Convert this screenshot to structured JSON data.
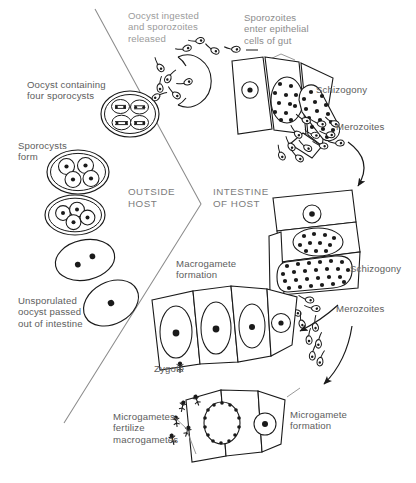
{
  "diagram": {
    "regions": [
      {
        "name": "outside-host",
        "label": "OUTSIDE\nHOST",
        "x": 128,
        "y": 186
      },
      {
        "name": "intestine-of-host",
        "label": "INTESTINE\nOF HOST",
        "x": 213,
        "y": 186
      }
    ],
    "labels": [
      {
        "name": "oocyst-ingested",
        "text": "Oocyst ingested\nand sporozoites\nreleased",
        "x": 128,
        "y": 10,
        "style": "faded"
      },
      {
        "name": "sporozoites-enter",
        "text": "Sporozoites\nenter epithelial\ncells of gut",
        "x": 244,
        "y": 12,
        "style": "faded2"
      },
      {
        "name": "schizogony-upper",
        "text": "Schizogony",
        "x": 316,
        "y": 84,
        "style": ""
      },
      {
        "name": "merozoites-upper",
        "text": "Merozoites",
        "x": 336,
        "y": 121,
        "style": ""
      },
      {
        "name": "oocyst-four-sporocysts",
        "text": "Oocyst containing\nfour sporocysts",
        "x": 27,
        "y": 79,
        "style": ""
      },
      {
        "name": "sporocysts-form",
        "text": "Sporocysts\nform",
        "x": 18,
        "y": 140,
        "style": ""
      },
      {
        "name": "unsporulated-oocyst",
        "text": "Unsporulated\noocyst passed\nout of intestine",
        "x": 18,
        "y": 295,
        "style": ""
      },
      {
        "name": "macrogamete-formation",
        "text": "Macrogamete\nformation",
        "x": 176,
        "y": 258,
        "style": ""
      },
      {
        "name": "schizogony-lower",
        "text": "Schizogony",
        "x": 350,
        "y": 263,
        "style": ""
      },
      {
        "name": "merozoites-lower",
        "text": "Merozoites",
        "x": 336,
        "y": 303,
        "style": ""
      },
      {
        "name": "zygote",
        "text": "Zygote",
        "x": 154,
        "y": 363,
        "style": ""
      },
      {
        "name": "microgametes-fertilize",
        "text": "Microgametes\nfertilize\nmacrogametes",
        "x": 113,
        "y": 411,
        "style": ""
      },
      {
        "name": "microgamete-formation",
        "text": "Microgamete\nformation",
        "x": 290,
        "y": 409,
        "style": ""
      }
    ],
    "stages": [
      {
        "name": "ingested-oocyst",
        "kind": "oocyst-with-sporozoites",
        "count": 8
      },
      {
        "name": "oocyst-four-sporocysts-figure",
        "kind": "oocyst",
        "sporocysts": 4,
        "sporozoites_per_sporocyst": 2
      },
      {
        "name": "sporulated-oocyst-four",
        "kind": "oocyst",
        "sporocysts": 4,
        "sporozoites_per_sporocyst": 1
      },
      {
        "name": "sporulating-oocyst",
        "kind": "oocyst",
        "sporocysts": 4,
        "sporozoites_per_sporocyst": 1
      },
      {
        "name": "two-cell-oocyst",
        "kind": "oocyst",
        "nuclei": 2
      },
      {
        "name": "unsporulated-oocyst-figure",
        "kind": "oocyst",
        "nuclei": 1
      },
      {
        "name": "epithelial-cell-trophozoite-upper",
        "kind": "epithelial-cell",
        "nuclei": 1
      },
      {
        "name": "schizont-early-upper",
        "kind": "epithelial-cell",
        "merozoite_nuclei": 13
      },
      {
        "name": "schizont-late-upper",
        "kind": "epithelial-cell",
        "merozoite_nuclei": 34
      },
      {
        "name": "epithelial-cell-trophozoite-lower",
        "kind": "epithelial-cell",
        "nuclei": 1
      },
      {
        "name": "schizont-early-lower",
        "kind": "epithelial-cell",
        "merozoite_nuclei": 14
      },
      {
        "name": "schizont-late-lower",
        "kind": "epithelial-cell",
        "merozoite_nuclei": 38
      },
      {
        "name": "macrogamete-cells",
        "kind": "epithelial-cell-row",
        "cells": 4
      },
      {
        "name": "microgamete-cells",
        "kind": "epithelial-cell-row",
        "cells": 2,
        "microgametocyte_nuclei": 18
      }
    ],
    "colors": {
      "ink": "#1a1a1a",
      "text": "#5d5d5d",
      "text_faded": "#9b9b9b",
      "background": "#ffffff",
      "divider": "#7b7b7b"
    }
  }
}
